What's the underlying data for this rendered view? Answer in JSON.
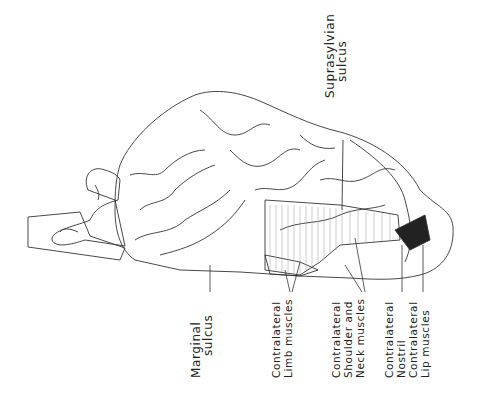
{
  "diagram": {
    "labels": {
      "suprasylvian": [
        "Suprasylvian",
        "sulcus"
      ],
      "marginal": [
        "Marginal",
        "sulcus"
      ],
      "limb": [
        "Contralateral",
        "Limb muscles"
      ],
      "shoulder": [
        "Contralateral",
        "Shoulder and",
        "Neck muscles"
      ],
      "nostril": [
        "Contralateral",
        "Nostril"
      ],
      "lip": [
        "Contralateral",
        "Lip muscles"
      ]
    },
    "colors": {
      "line": "#222222",
      "background": "#ffffff"
    }
  }
}
